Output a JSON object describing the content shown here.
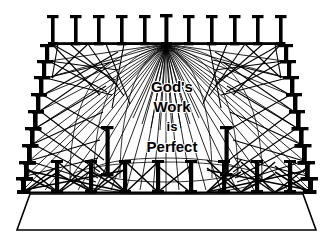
{
  "artwork": {
    "title": "God's Work is Perfect",
    "type": "line-drawing",
    "description": "Perspective line drawing of a colonnaded platform with radiating beams",
    "width": 333,
    "height": 247,
    "background_color": "#ffffff",
    "ink_color": "#000000"
  },
  "inscription": {
    "line1": "God's",
    "line2": "Work",
    "line3": "is",
    "line4": "Perfect",
    "full_text": "God's Work is Perfect",
    "color": "#000000"
  },
  "geometry": {
    "vanishing_point": {
      "x": 166,
      "y": 44
    },
    "back_row": {
      "post_count": 11,
      "beam_y": 44,
      "left_x": 52,
      "right_x": 281,
      "post_top_y": 15,
      "post_height": 29
    },
    "left_row": {
      "post_count": 10,
      "top_x": 52,
      "top_y": 44,
      "bottom_x": 23,
      "bottom_y": 190
    },
    "right_row": {
      "post_count": 10,
      "top_x": 281,
      "top_y": 44,
      "bottom_x": 310,
      "bottom_y": 190
    },
    "front_row": {
      "post_count": 9,
      "y": 190,
      "left_x": 23,
      "right_x": 310
    },
    "dome_arcs": {
      "count": 3,
      "center_x": 166,
      "apex_y": 46,
      "base_y": 178,
      "radii_x": [
        96,
        72,
        46
      ]
    },
    "base_platform": {
      "top_left_x": 30,
      "top_right_x": 303,
      "top_y": 193,
      "bottom_left_x": 17,
      "bottom_right_x": 316,
      "bottom_y": 230,
      "fill": "#ffffff",
      "stroke": "#000000"
    },
    "inner_posts": [
      {
        "x": 107,
        "y": 175,
        "height": 48
      },
      {
        "x": 226,
        "y": 175,
        "height": 48
      }
    ]
  }
}
